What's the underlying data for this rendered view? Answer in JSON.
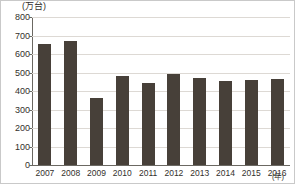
{
  "chart_data": {
    "type": "bar",
    "title": "",
    "subtitle": "",
    "xlabel": "(年)",
    "ylabel": "(万台)",
    "categories": [
      "2007",
      "2008",
      "2009",
      "2010",
      "2011",
      "2012",
      "2013",
      "2014",
      "2015",
      "2016"
    ],
    "values": [
      655,
      672,
      362,
      482,
      445,
      490,
      468,
      452,
      460,
      465
    ],
    "series": [
      {
        "name": "台数",
        "values": [
          655,
          672,
          362,
          482,
          445,
          490,
          468,
          452,
          460,
          465
        ]
      }
    ],
    "ylim": [
      0,
      800
    ],
    "ytick_labels": [
      "0",
      "100",
      "200",
      "300",
      "400",
      "500",
      "600",
      "700",
      "800"
    ],
    "ytick_values": [
      0,
      100,
      200,
      300,
      400,
      500,
      600,
      700,
      800
    ],
    "grid": true,
    "legend": false,
    "legend_position": "none",
    "bar_color": "#474039",
    "gridline_color": "#ddd9d4",
    "axis_color": "#6b6862",
    "frame_color": "#c9c9c9",
    "background_color": "#ffffff",
    "text_color": "#33302c"
  }
}
